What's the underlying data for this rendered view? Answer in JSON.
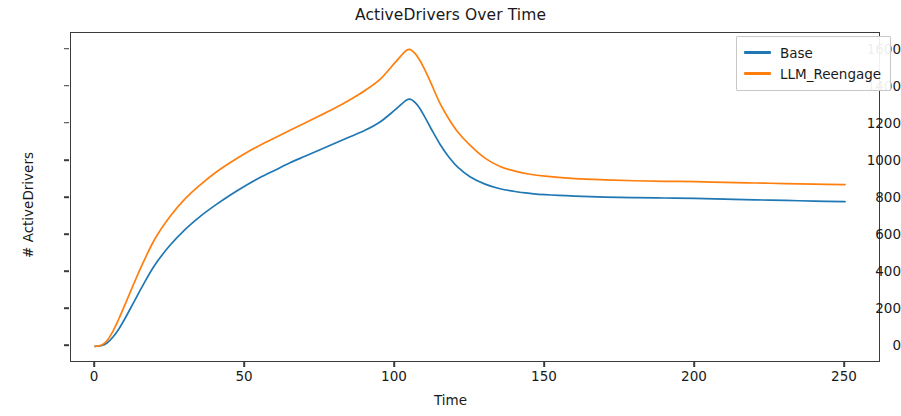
{
  "chart_data": {
    "type": "line",
    "title": "ActiveDrivers Over Time",
    "xlabel": "Time",
    "ylabel": "# ActiveDrivers",
    "xlim": [
      -8,
      262
    ],
    "ylim": [
      -90,
      1690
    ],
    "xticks": [
      0,
      50,
      100,
      150,
      200,
      250
    ],
    "yticks": [
      0,
      200,
      400,
      600,
      800,
      1000,
      1200,
      1400,
      1600
    ],
    "grid": false,
    "legend_position": "upper right",
    "colors": {
      "base": "#1f77b4",
      "llm_reengage": "#ff7f0e"
    },
    "x": [
      0,
      2,
      4,
      6,
      8,
      10,
      13,
      16,
      20,
      25,
      30,
      35,
      40,
      45,
      50,
      55,
      60,
      65,
      70,
      75,
      80,
      85,
      90,
      95,
      100,
      104,
      106,
      108,
      110,
      112,
      115,
      118,
      121,
      125,
      130,
      135,
      140,
      145,
      150,
      160,
      170,
      180,
      190,
      200,
      210,
      220,
      230,
      240,
      250
    ],
    "series": [
      {
        "name": "Base",
        "color": "#1f77b4",
        "values": [
          0,
          3,
          18,
          50,
          95,
          150,
          240,
          330,
          440,
          545,
          630,
          700,
          760,
          815,
          865,
          910,
          950,
          990,
          1025,
          1060,
          1095,
          1130,
          1165,
          1210,
          1275,
          1330,
          1325,
          1290,
          1235,
          1175,
          1090,
          1020,
          965,
          915,
          875,
          850,
          835,
          825,
          818,
          810,
          805,
          802,
          800,
          798,
          794,
          790,
          787,
          783,
          780
        ]
      },
      {
        "name": "LLM_Reengage",
        "color": "#ff7f0e",
        "values": [
          0,
          5,
          30,
          82,
          150,
          225,
          340,
          450,
          580,
          700,
          795,
          870,
          935,
          990,
          1040,
          1085,
          1125,
          1165,
          1205,
          1245,
          1285,
          1330,
          1380,
          1440,
          1530,
          1598,
          1590,
          1550,
          1490,
          1420,
          1310,
          1225,
          1155,
          1085,
          1015,
          970,
          945,
          928,
          918,
          905,
          898,
          893,
          890,
          888,
          884,
          881,
          878,
          875,
          872
        ]
      }
    ]
  },
  "legend": {
    "entries": [
      {
        "label": "Base"
      },
      {
        "label": "LLM_Reengage"
      }
    ]
  },
  "axes": {
    "ytick_labels": [
      "0",
      "200",
      "400",
      "600",
      "800",
      "1000",
      "1200",
      "1400",
      "1600"
    ],
    "xtick_labels": [
      "0",
      "50",
      "100",
      "150",
      "200",
      "250"
    ]
  }
}
